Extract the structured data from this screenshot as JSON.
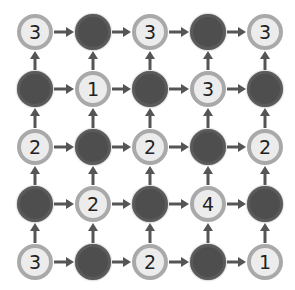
{
  "puzzle": {
    "rows": 5,
    "cols": 5,
    "colors": {
      "number_fill": "#ececec",
      "number_ring": "#a9a9a9",
      "shaded": "#4e4e4e",
      "arrow": "#555555"
    },
    "grid": [
      [
        {
          "type": "number",
          "value": "3"
        },
        {
          "type": "shaded",
          "value": ""
        },
        {
          "type": "number",
          "value": "3"
        },
        {
          "type": "shaded",
          "value": ""
        },
        {
          "type": "number",
          "value": "3"
        }
      ],
      [
        {
          "type": "shaded",
          "value": ""
        },
        {
          "type": "number",
          "value": "1"
        },
        {
          "type": "shaded",
          "value": ""
        },
        {
          "type": "number",
          "value": "3"
        },
        {
          "type": "shaded",
          "value": ""
        }
      ],
      [
        {
          "type": "number",
          "value": "2"
        },
        {
          "type": "shaded",
          "value": ""
        },
        {
          "type": "number",
          "value": "2"
        },
        {
          "type": "shaded",
          "value": ""
        },
        {
          "type": "number",
          "value": "2"
        }
      ],
      [
        {
          "type": "shaded",
          "value": ""
        },
        {
          "type": "number",
          "value": "2"
        },
        {
          "type": "shaded",
          "value": ""
        },
        {
          "type": "number",
          "value": "4"
        },
        {
          "type": "shaded",
          "value": ""
        }
      ],
      [
        {
          "type": "number",
          "value": "3"
        },
        {
          "type": "shaded",
          "value": ""
        },
        {
          "type": "number",
          "value": "2"
        },
        {
          "type": "shaded",
          "value": ""
        },
        {
          "type": "number",
          "value": "1"
        }
      ]
    ],
    "arrows": {
      "horizontal": "right",
      "vertical": "up"
    }
  }
}
